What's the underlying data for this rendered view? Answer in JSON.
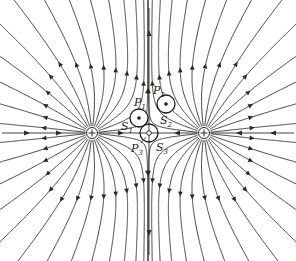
{
  "diagram": {
    "stroke_color": "#2a2a2a",
    "charges": [
      {
        "id": "q1",
        "sign": "+",
        "x": 92,
        "y": 133
      },
      {
        "id": "q2",
        "sign": "+",
        "x": 204,
        "y": 133
      }
    ],
    "midline": {
      "x": 149
    },
    "surfaces": [
      {
        "id": "S1",
        "label": "S",
        "sub": "1",
        "point_label": "P",
        "point_sub": "1",
        "cx": 139,
        "cy": 118,
        "r": 9,
        "center_mark": "dot"
      },
      {
        "id": "S2",
        "label": "S",
        "sub": "2",
        "point_label": "P",
        "point_sub": "2",
        "cx": 166,
        "cy": 104,
        "r": 9,
        "center_mark": "dot"
      },
      {
        "id": "S3",
        "label": "S",
        "sub": "3",
        "point_label": "P",
        "point_sub": "3",
        "cx": 149,
        "cy": 133,
        "r": 9,
        "center_mark": "ring"
      }
    ]
  }
}
